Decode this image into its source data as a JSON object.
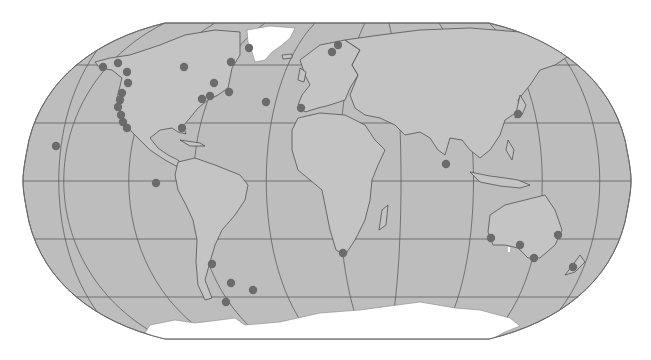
{
  "map": {
    "title": "World map with marked coastal locations",
    "projection": "Robinson",
    "colors": {
      "background": "#ffffff",
      "ocean": "#bdbdbd",
      "land": "#c4c4c4",
      "ice": "#ffffff",
      "border": "#555555",
      "graticule": "#5e5e5e",
      "outline": "#6a6a6a",
      "marker": "#6b6b6b"
    },
    "frame": {
      "left": 25,
      "right": 629,
      "top": 23,
      "bottom": 339,
      "equator_y": 181
    },
    "markers": [
      {
        "id": "alaska-west",
        "x": 103,
        "y": 67
      },
      {
        "id": "alaska-south",
        "x": 118,
        "y": 63
      },
      {
        "id": "bc-north",
        "x": 127,
        "y": 72
      },
      {
        "id": "bc-south",
        "x": 128,
        "y": 83
      },
      {
        "id": "washington",
        "x": 122,
        "y": 93
      },
      {
        "id": "oregon",
        "x": 120,
        "y": 100
      },
      {
        "id": "california-north",
        "x": 118,
        "y": 107
      },
      {
        "id": "california-central",
        "x": 121,
        "y": 115
      },
      {
        "id": "california-south",
        "x": 123,
        "y": 122
      },
      {
        "id": "baja",
        "x": 127,
        "y": 128
      },
      {
        "id": "hudson-bay",
        "x": 184,
        "y": 67
      },
      {
        "id": "labrador",
        "x": 231,
        "y": 62
      },
      {
        "id": "greenland-west",
        "x": 249,
        "y": 48
      },
      {
        "id": "quebec",
        "x": 214,
        "y": 83
      },
      {
        "id": "maine",
        "x": 210,
        "y": 96
      },
      {
        "id": "new-york",
        "x": 202,
        "y": 99
      },
      {
        "id": "newfoundland",
        "x": 229,
        "y": 92
      },
      {
        "id": "florida",
        "x": 182,
        "y": 128
      },
      {
        "id": "azores",
        "x": 266,
        "y": 102
      },
      {
        "id": "portugal",
        "x": 301,
        "y": 108
      },
      {
        "id": "norway-north",
        "x": 338,
        "y": 45
      },
      {
        "id": "norway-south",
        "x": 332,
        "y": 52
      },
      {
        "id": "hawaii",
        "x": 56,
        "y": 146
      },
      {
        "id": "galapagos",
        "x": 156,
        "y": 183
      },
      {
        "id": "japan",
        "x": 518,
        "y": 114
      },
      {
        "id": "sri-lanka",
        "x": 446,
        "y": 164
      },
      {
        "id": "patagonia",
        "x": 212,
        "y": 264
      },
      {
        "id": "argentina-south",
        "x": 231,
        "y": 283
      },
      {
        "id": "falklands",
        "x": 253,
        "y": 290
      },
      {
        "id": "tierra-del-fuego",
        "x": 226,
        "y": 302
      },
      {
        "id": "south-africa",
        "x": 343,
        "y": 253
      },
      {
        "id": "western-australia",
        "x": 491,
        "y": 238
      },
      {
        "id": "south-australia",
        "x": 520,
        "y": 245
      },
      {
        "id": "victoria",
        "x": 534,
        "y": 258
      },
      {
        "id": "queensland",
        "x": 558,
        "y": 235
      },
      {
        "id": "new-zealand",
        "x": 573,
        "y": 267
      }
    ]
  }
}
